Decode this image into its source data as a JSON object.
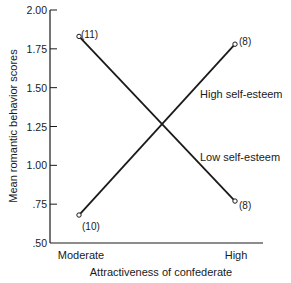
{
  "chart_data": {
    "type": "line",
    "title": "",
    "xlabel": "Attractiveness of confederate",
    "ylabel": "Mean romantic behavior scores",
    "categories": [
      "Moderate",
      "High"
    ],
    "ylim": [
      0.5,
      2.0
    ],
    "yticks": [
      ".50",
      ".75",
      "1.00",
      "1.25",
      "1.50",
      "1.75",
      "2.00"
    ],
    "ytick_values": [
      0.5,
      0.75,
      1.0,
      1.25,
      1.5,
      1.75,
      2.0
    ],
    "grid": false,
    "legend_position": "inline labels on right",
    "series": [
      {
        "name": "High self-esteem",
        "values": [
          0.68,
          1.78
        ],
        "n_labels": [
          "(10)",
          "(8)"
        ]
      },
      {
        "name": "Low self-esteem",
        "values": [
          1.83,
          0.77
        ],
        "n_labels": [
          "(11)",
          "(8)"
        ]
      }
    ]
  },
  "colors": {
    "line": "#1a1a1a",
    "background": "#ffffff"
  }
}
